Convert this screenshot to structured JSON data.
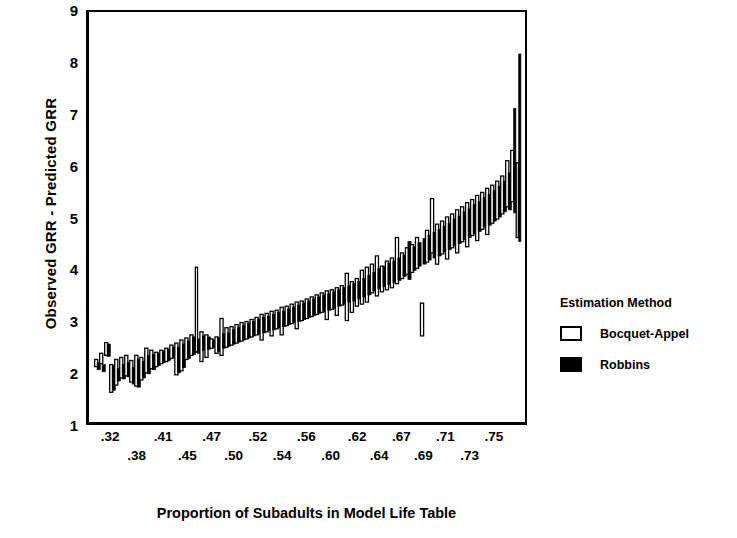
{
  "chart_data": {
    "type": "bar",
    "title": "",
    "xlabel": "Proportion of Subadults in Model Life Table",
    "ylabel": "Observed GRR - Predicted GRR",
    "ylim": [
      1,
      9
    ],
    "yticks": [
      1,
      2,
      3,
      4,
      5,
      6,
      7,
      8,
      9
    ],
    "ytick_labels": [
      "1",
      "2",
      "3",
      "4",
      "5",
      "6",
      "7",
      "8",
      "9"
    ],
    "xlim": [
      0,
      172
    ],
    "grid": false,
    "legend_position": "right",
    "xtick_labels_row0": [
      ".32",
      ".41",
      ".47",
      ".52",
      ".56",
      ".62",
      ".67",
      ".71",
      ".75"
    ],
    "xtick_labels_row1": [
      ".38",
      ".45",
      ".50",
      ".54",
      ".60",
      ".64",
      ".69",
      ".73"
    ],
    "xtick_positions_row0": [
      0.055,
      0.175,
      0.285,
      0.39,
      0.5,
      0.615,
      0.715,
      0.815,
      0.925
    ],
    "xtick_positions_row1": [
      0.115,
      0.23,
      0.335,
      0.445,
      0.555,
      0.665,
      0.765,
      0.87
    ],
    "series": [
      {
        "name": "Bocquet-Appel",
        "style": "open",
        "color": "#ffffff",
        "edge_color": "#000000"
      },
      {
        "name": "Robbins",
        "style": "filled",
        "color": "#000000",
        "edge_color": "#000000"
      }
    ],
    "note": "Each vertical bar is a confidence range (low,high) for one model life table at a given subadult proportion; bars alternate between the two estimation methods.",
    "bars": [
      {
        "i": 0,
        "s": 0,
        "lo": 2.08,
        "hi": 2.22
      },
      {
        "i": 1,
        "s": 1,
        "lo": 2.02,
        "hi": 2.16
      },
      {
        "i": 2,
        "s": 0,
        "lo": 2.14,
        "hi": 2.34
      },
      {
        "i": 3,
        "s": 1,
        "lo": 1.98,
        "hi": 2.12
      },
      {
        "i": 4,
        "s": 0,
        "lo": 2.3,
        "hi": 2.55
      },
      {
        "i": 5,
        "s": 1,
        "lo": 2.28,
        "hi": 2.52
      },
      {
        "i": 6,
        "s": 0,
        "lo": 1.58,
        "hi": 2.12
      },
      {
        "i": 7,
        "s": 1,
        "lo": 1.62,
        "hi": 2.1
      },
      {
        "i": 8,
        "s": 0,
        "lo": 1.72,
        "hi": 2.22
      },
      {
        "i": 9,
        "s": 1,
        "lo": 1.8,
        "hi": 2.04
      },
      {
        "i": 10,
        "s": 0,
        "lo": 1.86,
        "hi": 2.26
      },
      {
        "i": 11,
        "s": 1,
        "lo": 1.84,
        "hi": 2.12
      },
      {
        "i": 12,
        "s": 0,
        "lo": 1.9,
        "hi": 2.3
      },
      {
        "i": 13,
        "s": 1,
        "lo": 1.88,
        "hi": 2.16
      },
      {
        "i": 14,
        "s": 0,
        "lo": 1.78,
        "hi": 2.2
      },
      {
        "i": 15,
        "s": 1,
        "lo": 1.74,
        "hi": 2.06
      },
      {
        "i": 16,
        "s": 0,
        "lo": 1.7,
        "hi": 2.3
      },
      {
        "i": 17,
        "s": 1,
        "lo": 1.68,
        "hi": 2.22
      },
      {
        "i": 18,
        "s": 0,
        "lo": 1.82,
        "hi": 2.26
      },
      {
        "i": 19,
        "s": 1,
        "lo": 1.86,
        "hi": 2.18
      },
      {
        "i": 20,
        "s": 0,
        "lo": 1.96,
        "hi": 2.44
      },
      {
        "i": 21,
        "s": 1,
        "lo": 1.94,
        "hi": 2.3
      },
      {
        "i": 22,
        "s": 0,
        "lo": 2.04,
        "hi": 2.4
      },
      {
        "i": 23,
        "s": 1,
        "lo": 2.02,
        "hi": 2.32
      },
      {
        "i": 24,
        "s": 0,
        "lo": 2.08,
        "hi": 2.36
      },
      {
        "i": 25,
        "s": 1,
        "lo": 2.1,
        "hi": 2.34
      },
      {
        "i": 26,
        "s": 0,
        "lo": 2.14,
        "hi": 2.4
      },
      {
        "i": 27,
        "s": 1,
        "lo": 2.16,
        "hi": 2.38
      },
      {
        "i": 28,
        "s": 0,
        "lo": 2.18,
        "hi": 2.44
      },
      {
        "i": 29,
        "s": 1,
        "lo": 2.2,
        "hi": 2.42
      },
      {
        "i": 30,
        "s": 0,
        "lo": 2.24,
        "hi": 2.5
      },
      {
        "i": 31,
        "s": 1,
        "lo": 2.26,
        "hi": 2.46
      },
      {
        "i": 32,
        "s": 0,
        "lo": 1.92,
        "hi": 2.54
      },
      {
        "i": 33,
        "s": 1,
        "lo": 1.96,
        "hi": 2.46
      },
      {
        "i": 34,
        "s": 0,
        "lo": 2.0,
        "hi": 2.6
      },
      {
        "i": 35,
        "s": 1,
        "lo": 2.06,
        "hi": 2.52
      },
      {
        "i": 36,
        "s": 0,
        "lo": 2.22,
        "hi": 2.64
      },
      {
        "i": 37,
        "s": 1,
        "lo": 2.24,
        "hi": 2.58
      },
      {
        "i": 38,
        "s": 0,
        "lo": 2.3,
        "hi": 2.7
      },
      {
        "i": 39,
        "s": 1,
        "lo": 2.32,
        "hi": 2.66
      },
      {
        "i": 40,
        "s": 0,
        "lo": 2.36,
        "hi": 4.02
      },
      {
        "i": 41,
        "s": 1,
        "lo": 2.34,
        "hi": 2.62
      },
      {
        "i": 42,
        "s": 0,
        "lo": 2.18,
        "hi": 2.76
      },
      {
        "i": 43,
        "s": 1,
        "lo": 2.4,
        "hi": 2.68
      },
      {
        "i": 44,
        "s": 0,
        "lo": 2.26,
        "hi": 2.7
      },
      {
        "i": 45,
        "s": 1,
        "lo": 2.42,
        "hi": 2.66
      },
      {
        "i": 46,
        "s": 0,
        "lo": 2.44,
        "hi": 2.62
      },
      {
        "i": 47,
        "s": 1,
        "lo": 2.46,
        "hi": 2.6
      },
      {
        "i": 48,
        "s": 0,
        "lo": 2.34,
        "hi": 2.66
      },
      {
        "i": 49,
        "s": 1,
        "lo": 2.38,
        "hi": 2.64
      },
      {
        "i": 50,
        "s": 0,
        "lo": 2.3,
        "hi": 3.02
      },
      {
        "i": 51,
        "s": 1,
        "lo": 2.44,
        "hi": 2.72
      },
      {
        "i": 52,
        "s": 0,
        "lo": 2.46,
        "hi": 2.84
      },
      {
        "i": 53,
        "s": 1,
        "lo": 2.48,
        "hi": 2.74
      },
      {
        "i": 54,
        "s": 0,
        "lo": 2.5,
        "hi": 2.86
      },
      {
        "i": 55,
        "s": 1,
        "lo": 2.52,
        "hi": 2.8
      },
      {
        "i": 56,
        "s": 0,
        "lo": 2.54,
        "hi": 2.9
      },
      {
        "i": 57,
        "s": 1,
        "lo": 2.56,
        "hi": 2.84
      },
      {
        "i": 58,
        "s": 0,
        "lo": 2.58,
        "hi": 2.94
      },
      {
        "i": 59,
        "s": 1,
        "lo": 2.6,
        "hi": 2.88
      },
      {
        "i": 60,
        "s": 0,
        "lo": 2.62,
        "hi": 2.96
      },
      {
        "i": 61,
        "s": 1,
        "lo": 2.64,
        "hi": 2.92
      },
      {
        "i": 62,
        "s": 0,
        "lo": 2.66,
        "hi": 3.0
      },
      {
        "i": 63,
        "s": 1,
        "lo": 2.68,
        "hi": 2.96
      },
      {
        "i": 64,
        "s": 0,
        "lo": 2.7,
        "hi": 3.04
      },
      {
        "i": 65,
        "s": 1,
        "lo": 2.72,
        "hi": 3.0
      },
      {
        "i": 66,
        "s": 0,
        "lo": 2.6,
        "hi": 3.1
      },
      {
        "i": 67,
        "s": 1,
        "lo": 2.74,
        "hi": 3.04
      },
      {
        "i": 68,
        "s": 0,
        "lo": 2.76,
        "hi": 3.12
      },
      {
        "i": 69,
        "s": 1,
        "lo": 2.78,
        "hi": 3.06
      },
      {
        "i": 70,
        "s": 0,
        "lo": 2.68,
        "hi": 3.16
      },
      {
        "i": 71,
        "s": 1,
        "lo": 2.8,
        "hi": 3.1
      },
      {
        "i": 72,
        "s": 0,
        "lo": 2.82,
        "hi": 3.18
      },
      {
        "i": 73,
        "s": 1,
        "lo": 2.84,
        "hi": 3.14
      },
      {
        "i": 74,
        "s": 0,
        "lo": 2.7,
        "hi": 3.24
      },
      {
        "i": 75,
        "s": 1,
        "lo": 2.86,
        "hi": 3.16
      },
      {
        "i": 76,
        "s": 0,
        "lo": 2.88,
        "hi": 3.26
      },
      {
        "i": 77,
        "s": 1,
        "lo": 2.9,
        "hi": 3.2
      },
      {
        "i": 78,
        "s": 0,
        "lo": 2.92,
        "hi": 3.3
      },
      {
        "i": 79,
        "s": 1,
        "lo": 2.94,
        "hi": 3.24
      },
      {
        "i": 80,
        "s": 0,
        "lo": 2.82,
        "hi": 3.34
      },
      {
        "i": 81,
        "s": 1,
        "lo": 2.96,
        "hi": 3.28
      },
      {
        "i": 82,
        "s": 0,
        "lo": 2.98,
        "hi": 3.36
      },
      {
        "i": 83,
        "s": 1,
        "lo": 3.0,
        "hi": 3.32
      },
      {
        "i": 84,
        "s": 0,
        "lo": 3.02,
        "hi": 3.4
      },
      {
        "i": 85,
        "s": 1,
        "lo": 3.04,
        "hi": 3.36
      },
      {
        "i": 86,
        "s": 0,
        "lo": 3.06,
        "hi": 3.44
      },
      {
        "i": 87,
        "s": 1,
        "lo": 3.08,
        "hi": 3.4
      },
      {
        "i": 88,
        "s": 0,
        "lo": 3.1,
        "hi": 3.48
      },
      {
        "i": 89,
        "s": 1,
        "lo": 3.12,
        "hi": 3.44
      },
      {
        "i": 90,
        "s": 0,
        "lo": 3.14,
        "hi": 3.52
      },
      {
        "i": 91,
        "s": 1,
        "lo": 3.16,
        "hi": 3.48
      },
      {
        "i": 92,
        "s": 0,
        "lo": 3.0,
        "hi": 3.56
      },
      {
        "i": 93,
        "s": 1,
        "lo": 3.18,
        "hi": 3.5
      },
      {
        "i": 94,
        "s": 0,
        "lo": 3.2,
        "hi": 3.58
      },
      {
        "i": 95,
        "s": 1,
        "lo": 3.22,
        "hi": 3.54
      },
      {
        "i": 96,
        "s": 0,
        "lo": 3.08,
        "hi": 3.62
      },
      {
        "i": 97,
        "s": 1,
        "lo": 3.26,
        "hi": 3.58
      },
      {
        "i": 98,
        "s": 0,
        "lo": 3.28,
        "hi": 3.66
      },
      {
        "i": 99,
        "s": 1,
        "lo": 3.3,
        "hi": 3.62
      },
      {
        "i": 100,
        "s": 0,
        "lo": 2.98,
        "hi": 3.9
      },
      {
        "i": 101,
        "s": 1,
        "lo": 3.34,
        "hi": 3.66
      },
      {
        "i": 102,
        "s": 0,
        "lo": 3.14,
        "hi": 3.74
      },
      {
        "i": 103,
        "s": 1,
        "lo": 3.36,
        "hi": 3.7
      },
      {
        "i": 104,
        "s": 0,
        "lo": 3.26,
        "hi": 3.8
      },
      {
        "i": 105,
        "s": 1,
        "lo": 3.4,
        "hi": 3.74
      },
      {
        "i": 106,
        "s": 0,
        "lo": 3.3,
        "hi": 3.96
      },
      {
        "i": 107,
        "s": 1,
        "lo": 3.44,
        "hi": 3.8
      },
      {
        "i": 108,
        "s": 0,
        "lo": 3.34,
        "hi": 4.02
      },
      {
        "i": 109,
        "s": 1,
        "lo": 3.48,
        "hi": 3.86
      },
      {
        "i": 110,
        "s": 0,
        "lo": 3.52,
        "hi": 4.08
      },
      {
        "i": 111,
        "s": 1,
        "lo": 3.56,
        "hi": 3.92
      },
      {
        "i": 112,
        "s": 0,
        "lo": 3.46,
        "hi": 4.24
      },
      {
        "i": 113,
        "s": 1,
        "lo": 3.6,
        "hi": 4.0
      },
      {
        "i": 114,
        "s": 0,
        "lo": 3.54,
        "hi": 4.04
      },
      {
        "i": 115,
        "s": 1,
        "lo": 3.64,
        "hi": 4.04
      },
      {
        "i": 116,
        "s": 0,
        "lo": 3.58,
        "hi": 4.14
      },
      {
        "i": 117,
        "s": 1,
        "lo": 3.68,
        "hi": 4.1
      },
      {
        "i": 118,
        "s": 0,
        "lo": 3.62,
        "hi": 4.2
      },
      {
        "i": 119,
        "s": 1,
        "lo": 3.72,
        "hi": 4.14
      },
      {
        "i": 120,
        "s": 0,
        "lo": 3.7,
        "hi": 4.6
      },
      {
        "i": 121,
        "s": 1,
        "lo": 3.76,
        "hi": 4.2
      },
      {
        "i": 122,
        "s": 0,
        "lo": 3.8,
        "hi": 4.3
      },
      {
        "i": 123,
        "s": 1,
        "lo": 3.84,
        "hi": 4.26
      },
      {
        "i": 124,
        "s": 0,
        "lo": 3.88,
        "hi": 4.4
      },
      {
        "i": 125,
        "s": 1,
        "lo": 3.78,
        "hi": 4.52
      },
      {
        "i": 126,
        "s": 0,
        "lo": 3.92,
        "hi": 4.46
      },
      {
        "i": 127,
        "s": 1,
        "lo": 3.96,
        "hi": 4.42
      },
      {
        "i": 128,
        "s": 0,
        "lo": 4.0,
        "hi": 4.6
      },
      {
        "i": 129,
        "s": 1,
        "lo": 4.04,
        "hi": 4.5
      },
      {
        "i": 130,
        "s": 0,
        "lo": 2.68,
        "hi": 3.32
      },
      {
        "i": 131,
        "s": 1,
        "lo": 4.08,
        "hi": 4.58
      },
      {
        "i": 132,
        "s": 0,
        "lo": 4.12,
        "hi": 4.74
      },
      {
        "i": 133,
        "s": 1,
        "lo": 4.16,
        "hi": 4.64
      },
      {
        "i": 134,
        "s": 0,
        "lo": 4.3,
        "hi": 5.36
      },
      {
        "i": 135,
        "s": 1,
        "lo": 4.2,
        "hi": 4.7
      },
      {
        "i": 136,
        "s": 0,
        "lo": 4.08,
        "hi": 4.86
      },
      {
        "i": 137,
        "s": 1,
        "lo": 4.24,
        "hi": 4.76
      },
      {
        "i": 138,
        "s": 0,
        "lo": 4.28,
        "hi": 4.92
      },
      {
        "i": 139,
        "s": 1,
        "lo": 4.32,
        "hi": 4.82
      },
      {
        "i": 140,
        "s": 0,
        "lo": 4.18,
        "hi": 5.0
      },
      {
        "i": 141,
        "s": 1,
        "lo": 4.36,
        "hi": 4.88
      },
      {
        "i": 142,
        "s": 0,
        "lo": 4.4,
        "hi": 5.06
      },
      {
        "i": 143,
        "s": 1,
        "lo": 4.44,
        "hi": 4.96
      },
      {
        "i": 144,
        "s": 0,
        "lo": 4.3,
        "hi": 5.14
      },
      {
        "i": 145,
        "s": 1,
        "lo": 4.48,
        "hi": 5.02
      },
      {
        "i": 146,
        "s": 0,
        "lo": 4.52,
        "hi": 5.2
      },
      {
        "i": 147,
        "s": 1,
        "lo": 4.56,
        "hi": 5.1
      },
      {
        "i": 148,
        "s": 0,
        "lo": 4.42,
        "hi": 5.28
      },
      {
        "i": 149,
        "s": 1,
        "lo": 4.6,
        "hi": 5.16
      },
      {
        "i": 150,
        "s": 0,
        "lo": 4.64,
        "hi": 5.34
      },
      {
        "i": 151,
        "s": 1,
        "lo": 4.68,
        "hi": 5.24
      },
      {
        "i": 152,
        "s": 0,
        "lo": 4.54,
        "hi": 5.42
      },
      {
        "i": 153,
        "s": 1,
        "lo": 4.72,
        "hi": 5.3
      },
      {
        "i": 154,
        "s": 0,
        "lo": 4.76,
        "hi": 5.48
      },
      {
        "i": 155,
        "s": 1,
        "lo": 4.8,
        "hi": 5.38
      },
      {
        "i": 156,
        "s": 0,
        "lo": 4.66,
        "hi": 5.56
      },
      {
        "i": 157,
        "s": 1,
        "lo": 4.84,
        "hi": 5.44
      },
      {
        "i": 158,
        "s": 0,
        "lo": 4.88,
        "hi": 5.62
      },
      {
        "i": 159,
        "s": 1,
        "lo": 4.92,
        "hi": 5.52
      },
      {
        "i": 160,
        "s": 0,
        "lo": 4.96,
        "hi": 5.7
      },
      {
        "i": 161,
        "s": 1,
        "lo": 5.0,
        "hi": 5.6
      },
      {
        "i": 162,
        "s": 0,
        "lo": 5.06,
        "hi": 5.8
      },
      {
        "i": 163,
        "s": 1,
        "lo": 5.1,
        "hi": 5.7
      },
      {
        "i": 164,
        "s": 0,
        "lo": 5.2,
        "hi": 6.1
      },
      {
        "i": 165,
        "s": 1,
        "lo": 5.14,
        "hi": 5.86
      },
      {
        "i": 166,
        "s": 0,
        "lo": 5.3,
        "hi": 6.3
      },
      {
        "i": 167,
        "s": 1,
        "lo": 5.08,
        "hi": 7.12
      },
      {
        "i": 168,
        "s": 0,
        "lo": 4.6,
        "hi": 6.06
      },
      {
        "i": 169,
        "s": 1,
        "lo": 4.52,
        "hi": 8.18
      }
    ]
  },
  "legend": {
    "title": "Estimation Method",
    "items": [
      {
        "label": "Bocquet-Appel",
        "style": "open"
      },
      {
        "label": "Robbins",
        "style": "filled"
      }
    ]
  }
}
